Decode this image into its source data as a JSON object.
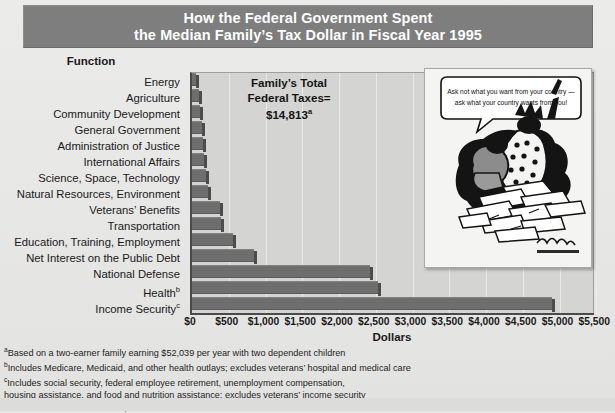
{
  "title": {
    "line1": "How the Federal Government Spent",
    "line2": "the Median Family’s Tax Dollar in Fiscal Year 1995"
  },
  "function_header": "Function",
  "annotation": {
    "line1": "Family’s Total",
    "line2": "Federal Taxes=",
    "line3": "$14,813",
    "line3_sup": "a"
  },
  "cartoon": {
    "caption_line1": "Ask not what you want from your country —",
    "caption_line2": "ask what your country wants from you!",
    "signature": "Ramirez"
  },
  "xaxis_title": "Dollars",
  "footnotes": [
    {
      "marker": "a",
      "text": "Based on a two-earner family earning $52,039 per year with two dependent children"
    },
    {
      "marker": "b",
      "text": "Includes Medicare, Medicaid, and other health outlays; excludes veterans’ hospital and medical care"
    },
    {
      "marker": "c",
      "text": "Includes social security, federal employee retirement, unemployment compensation,"
    },
    {
      "marker": "",
      "text": " housing assistance, and food and nutrition assistance; excludes veterans’ income security"
    }
  ],
  "source": "Source: The Tax Foundation, Inc.",
  "colors": {
    "banner": "#7e7e7e",
    "bar": "#6e6e6e",
    "plot_bg": "#d4d4d2",
    "page_bg": "#e8e8e6",
    "axis": "#4a4a4a"
  },
  "chart_data": {
    "type": "bar",
    "orientation": "horizontal",
    "title": "How the Federal Government Spent the Median Family’s Tax Dollar in Fiscal Year 1995",
    "xlabel": "Dollars",
    "ylabel": "Function",
    "xlim": [
      0,
      5500
    ],
    "grid": true,
    "legend": null,
    "tick_labels": [
      "$0",
      "$500",
      "$1,000",
      "$1,500",
      "$2,000",
      "$2,500",
      "$3,000",
      "$3,500",
      "$4,000",
      "$4,500",
      "$5,000",
      "$5,500"
    ],
    "tick_values": [
      0,
      500,
      1000,
      1500,
      2000,
      2500,
      3000,
      3500,
      4000,
      4500,
      5000,
      5500
    ],
    "categories": [
      "Energy",
      "Agriculture",
      "Community Development",
      "General Government",
      "Administration of Justice",
      "International Affairs",
      "Science, Space, Technology",
      "Natural Resources, Environment",
      "Veterans’ Benefits",
      "Transportation",
      "Education, Training, Employment",
      "Net Interest on the Public Debt",
      "National Defense",
      "Health",
      "Income Security"
    ],
    "category_footnotes": [
      "",
      "",
      "",
      "",
      "",
      "",
      "",
      "",
      "",
      "",
      "",
      "",
      "",
      "b",
      "c"
    ],
    "values": [
      60,
      95,
      110,
      130,
      150,
      170,
      190,
      215,
      385,
      400,
      560,
      845,
      2420,
      2530,
      4900
    ],
    "total_federal_taxes": 14813
  }
}
